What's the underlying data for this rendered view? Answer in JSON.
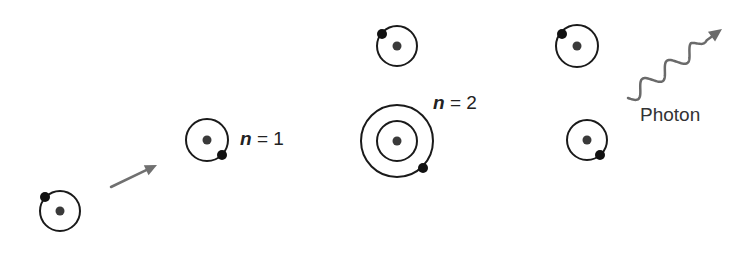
{
  "diagram": {
    "colors": {
      "orbit": "#1a1a1a",
      "nucleus": "#3a3a3a",
      "electron": "#111111",
      "arrow": "#707070"
    },
    "atoms": [
      {
        "id": "atom-incoming",
        "cx": 60,
        "cy": 211,
        "orbits": [
          20
        ],
        "electron": {
          "x": 45,
          "y": 197
        }
      },
      {
        "id": "atom-ground-target",
        "cx": 207,
        "cy": 140,
        "orbits": [
          21
        ],
        "electron": {
          "x": 222,
          "y": 155
        }
      },
      {
        "id": "atom-scattered-top",
        "cx": 397,
        "cy": 46,
        "orbits": [
          20
        ],
        "electron": {
          "x": 382,
          "y": 34
        }
      },
      {
        "id": "atom-excited",
        "cx": 397,
        "cy": 141,
        "orbits": [
          20,
          36
        ],
        "electron": {
          "x": 423,
          "y": 168
        }
      },
      {
        "id": "atom-top-right",
        "cx": 577,
        "cy": 46,
        "orbits": [
          21
        ],
        "electron": {
          "x": 562,
          "y": 34
        }
      },
      {
        "id": "atom-deexcited",
        "cx": 587,
        "cy": 140,
        "orbits": [
          20
        ],
        "electron": {
          "x": 600,
          "y": 155
        }
      }
    ],
    "labels": {
      "n1": {
        "var": "n",
        "rest": " = 1"
      },
      "n2": {
        "var": "n",
        "rest": " = 2"
      },
      "photon": "Photon"
    },
    "arrow": {
      "x1": 111,
      "y1": 187,
      "x2": 157,
      "y2": 165
    },
    "photon_wave": {
      "x1": 628,
      "y1": 98,
      "x2": 722,
      "y2": 29
    }
  }
}
